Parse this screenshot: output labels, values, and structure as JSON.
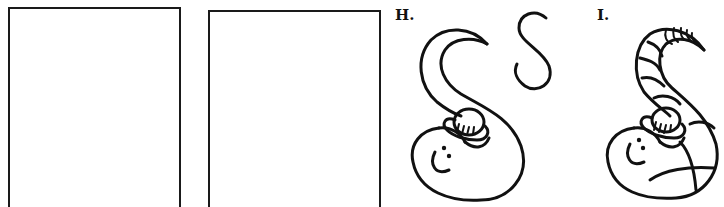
{
  "practice_frames": [
    {
      "id": "frame-1",
      "content": ""
    },
    {
      "id": "frame-2",
      "content": ""
    }
  ],
  "steps": [
    {
      "label": "H.",
      "description": "Worm shaped like letter S with smiling face, clip and small S guide"
    },
    {
      "label": "I.",
      "description": "Finished worm with segment stripes along body and tail"
    }
  ],
  "guide_letter": "S",
  "colors": {
    "ink": "#111111",
    "background": "#ffffff"
  }
}
